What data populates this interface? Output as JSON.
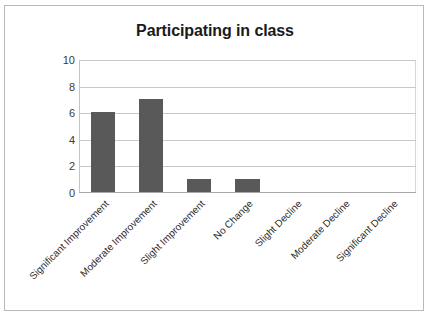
{
  "chart_data": {
    "type": "bar",
    "title": "Participating in class",
    "xlabel": "",
    "ylabel": "",
    "categories": [
      "Significant Improvement",
      "Moderate Improvement",
      "Slight Improvement",
      "No Change",
      "Slight Decline",
      "Moderate Decline",
      "Significant Decline"
    ],
    "values": [
      6,
      7,
      1,
      1,
      0,
      0,
      0
    ],
    "ylim": [
      0,
      10
    ],
    "yticks": [
      0,
      2,
      4,
      6,
      8,
      10
    ],
    "ytick_labels": [
      "0",
      "2",
      "4",
      "6",
      "8",
      "10"
    ],
    "grid": true,
    "legend": false,
    "bar_color": "#595959",
    "gridline_color": "#c8c8c8",
    "axis_color": "#a8a8a8",
    "label_rotation_deg": -45
  }
}
